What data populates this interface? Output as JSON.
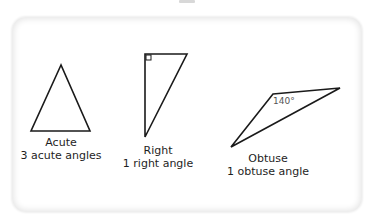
{
  "diagram": {
    "type": "triangle-classification",
    "colors": {
      "stroke": "#1a1a1a",
      "text": "#1e1e1e",
      "angle_label": "#555555",
      "card_border": "#e6e6e6"
    },
    "triangles": [
      {
        "name": "Acute",
        "description": "3 acute angles"
      },
      {
        "name": "Right",
        "description": "1 right angle",
        "marker": "right-angle-square"
      },
      {
        "name": "Obtuse",
        "description": "1 obtuse angle",
        "angle_label": "140°"
      }
    ]
  }
}
